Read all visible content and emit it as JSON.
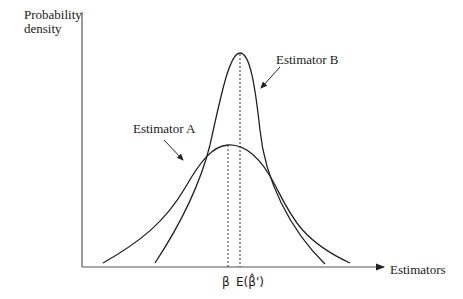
{
  "figure": {
    "y_axis_label": "Probability density",
    "x_axis_label": "Estimators",
    "curves": [
      {
        "name": "Estimator A",
        "label": "Estimator A",
        "shape": "wide, lower peak",
        "peak_at": "β"
      },
      {
        "name": "Estimator B",
        "label": "Estimator B",
        "shape": "narrow, tall peak",
        "peak_at": "E(β̂')"
      }
    ],
    "markers": [
      {
        "label": "β",
        "style": "dashed vertical line"
      },
      {
        "label": "E(β̂')",
        "style": "dashed vertical line"
      }
    ],
    "colors": {
      "line": "#222222",
      "background": "#ffffff"
    }
  }
}
